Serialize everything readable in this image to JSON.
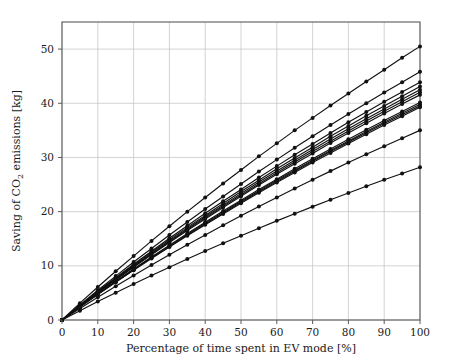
{
  "chart_data": {
    "type": "line",
    "title": "",
    "subtitle": "",
    "xlabel": "Percentage of time spent in EV mode [%]",
    "ylabel": "Saving of CO2 emissions [kg]",
    "ylabel_parts": {
      "pre": "Saving of CO",
      "sub": "2",
      "post": " emissions [kg]"
    },
    "xlim": [
      0,
      100
    ],
    "ylim": [
      0,
      55
    ],
    "xticks": [
      0,
      10,
      20,
      30,
      40,
      50,
      60,
      70,
      80,
      90,
      100
    ],
    "yticks": [
      0,
      10,
      20,
      30,
      40,
      50
    ],
    "grid": true,
    "grid_color": "#c8c8c8",
    "legend": "none",
    "marker": "circle-filled",
    "marker_color": "#111111",
    "line_color": "#111111",
    "x": [
      0,
      5,
      10,
      15,
      20,
      25,
      30,
      35,
      40,
      45,
      50,
      55,
      60,
      65,
      70,
      75,
      80,
      85,
      90,
      95,
      100
    ],
    "series": [
      {
        "name": "vehicle-1",
        "values": [
          0,
          3.1,
          6.1,
          9.0,
          11.8,
          14.6,
          17.3,
          20.0,
          22.6,
          25.2,
          27.7,
          30.2,
          32.6,
          35.0,
          37.3,
          39.6,
          41.8,
          44.0,
          46.2,
          48.4,
          50.5
        ]
      },
      {
        "name": "vehicle-2",
        "values": [
          0,
          2.8,
          5.5,
          8.1,
          10.7,
          13.2,
          15.7,
          18.1,
          20.5,
          22.8,
          25.1,
          27.4,
          29.6,
          31.8,
          33.9,
          36.0,
          38.0,
          40.0,
          42.0,
          43.9,
          45.8
        ]
      },
      {
        "name": "vehicle-3",
        "values": [
          0,
          2.7,
          5.3,
          7.8,
          10.3,
          12.7,
          15.1,
          17.4,
          19.7,
          21.9,
          24.1,
          26.3,
          28.4,
          30.5,
          32.5,
          34.5,
          36.5,
          38.4,
          40.3,
          42.1,
          43.9
        ]
      },
      {
        "name": "vehicle-4",
        "values": [
          0,
          2.65,
          5.2,
          7.7,
          10.1,
          12.5,
          14.8,
          17.1,
          19.3,
          21.5,
          23.7,
          25.8,
          27.9,
          29.9,
          31.9,
          33.9,
          35.8,
          37.7,
          39.5,
          41.3,
          43.1
        ]
      },
      {
        "name": "vehicle-5",
        "values": [
          0,
          2.6,
          5.1,
          7.55,
          9.95,
          12.3,
          14.6,
          16.85,
          19.05,
          21.2,
          23.35,
          25.45,
          27.5,
          29.5,
          31.45,
          33.4,
          35.3,
          37.15,
          38.95,
          40.75,
          42.5
        ]
      },
      {
        "name": "vehicle-6",
        "values": [
          0,
          2.58,
          5.06,
          7.48,
          9.85,
          12.18,
          14.45,
          16.68,
          18.85,
          20.98,
          23.08,
          25.15,
          27.18,
          29.15,
          31.08,
          33.0,
          34.88,
          36.72,
          38.52,
          40.3,
          42.05
        ]
      },
      {
        "name": "vehicle-7",
        "values": [
          0,
          2.55,
          5.0,
          7.4,
          9.75,
          12.05,
          14.3,
          16.5,
          18.65,
          20.75,
          22.85,
          24.9,
          26.9,
          28.85,
          30.75,
          32.65,
          34.5,
          36.3,
          38.1,
          39.85,
          41.55
        ]
      },
      {
        "name": "vehicle-8",
        "values": [
          0,
          2.45,
          4.82,
          7.15,
          9.42,
          11.65,
          13.82,
          15.95,
          18.05,
          20.1,
          22.1,
          24.08,
          26.0,
          27.9,
          29.75,
          31.55,
          33.35,
          35.1,
          36.8,
          38.5,
          40.15
        ]
      },
      {
        "name": "vehicle-9",
        "values": [
          0,
          2.42,
          4.78,
          7.08,
          9.33,
          11.53,
          13.68,
          15.8,
          17.88,
          19.9,
          21.9,
          23.85,
          25.78,
          27.65,
          29.5,
          31.3,
          33.05,
          34.8,
          36.5,
          38.15,
          39.8
        ]
      },
      {
        "name": "vehicle-10",
        "values": [
          0,
          2.4,
          4.74,
          7.02,
          9.25,
          11.43,
          13.58,
          15.68,
          17.73,
          19.75,
          21.73,
          23.68,
          25.58,
          27.45,
          29.28,
          31.08,
          32.83,
          34.55,
          36.25,
          37.9,
          39.52
        ]
      },
      {
        "name": "vehicle-11",
        "values": [
          0,
          2.38,
          4.7,
          6.96,
          9.17,
          11.35,
          13.47,
          15.55,
          17.58,
          19.58,
          21.55,
          23.48,
          25.38,
          27.23,
          29.05,
          30.83,
          32.58,
          34.3,
          35.98,
          37.62,
          39.25
        ]
      },
      {
        "name": "vehicle-12",
        "values": [
          0,
          2.12,
          4.2,
          6.22,
          8.2,
          10.13,
          12.03,
          13.88,
          15.7,
          17.48,
          19.23,
          20.95,
          22.63,
          24.28,
          25.9,
          27.48,
          29.05,
          30.58,
          32.08,
          33.55,
          35.0
        ]
      },
      {
        "name": "vehicle-13",
        "values": [
          0,
          1.72,
          3.4,
          5.05,
          6.65,
          8.22,
          9.75,
          11.25,
          12.72,
          14.15,
          15.55,
          16.95,
          18.3,
          19.62,
          20.92,
          22.2,
          23.45,
          24.68,
          25.88,
          27.05,
          28.2
        ]
      }
    ]
  }
}
